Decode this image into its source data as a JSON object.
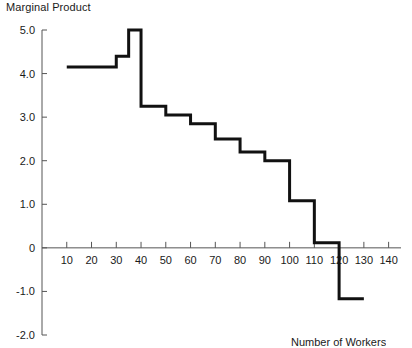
{
  "chart_data": {
    "type": "line",
    "style": "step-post",
    "title": "Marginal Product",
    "xlabel": "Number of Workers",
    "ylabel": "Marginal Product",
    "xlim": [
      0,
      145
    ],
    "ylim": [
      -2.0,
      5.0
    ],
    "grid": false,
    "legend": null,
    "xticks": [
      10,
      20,
      30,
      40,
      50,
      60,
      70,
      80,
      90,
      100,
      110,
      120,
      130,
      140
    ],
    "xticklabels": [
      "10",
      "20",
      "30",
      "40",
      "50",
      "60",
      "70",
      "80",
      "90",
      "100",
      "110",
      "120",
      "130",
      "140"
    ],
    "yticks": [
      5.0,
      4.0,
      3.0,
      2.0,
      1.0,
      0,
      -1.0,
      -2.0
    ],
    "yticklabels": [
      "5.0",
      "4.0",
      "3.0",
      "2.0",
      "1.0",
      "0",
      "-1.0",
      "-2.0"
    ],
    "steps": [
      {
        "x_start": 10,
        "x_end": 20,
        "value": 4.15
      },
      {
        "x_start": 20,
        "x_end": 30,
        "value": 4.15
      },
      {
        "x_start": 30,
        "x_end": 35,
        "value": 4.4
      },
      {
        "x_start": 35,
        "x_end": 40,
        "value": 5.0
      },
      {
        "x_start": 40,
        "x_end": 50,
        "value": 3.25
      },
      {
        "x_start": 50,
        "x_end": 60,
        "value": 3.05
      },
      {
        "x_start": 60,
        "x_end": 70,
        "value": 2.85
      },
      {
        "x_start": 70,
        "x_end": 80,
        "value": 2.5
      },
      {
        "x_start": 80,
        "x_end": 90,
        "value": 2.2
      },
      {
        "x_start": 90,
        "x_end": 100,
        "value": 2.0
      },
      {
        "x_start": 100,
        "x_end": 110,
        "value": 1.08
      },
      {
        "x_start": 110,
        "x_end": 120,
        "value": 0.12
      },
      {
        "x_start": 120,
        "x_end": 130,
        "value": -1.17
      }
    ],
    "x": [
      10,
      20,
      30,
      35,
      40,
      50,
      60,
      70,
      80,
      90,
      100,
      110,
      120,
      130
    ],
    "values": [
      4.15,
      4.15,
      4.4,
      5.0,
      3.25,
      3.05,
      2.85,
      2.5,
      2.2,
      2.0,
      1.08,
      0.12,
      -1.17,
      -1.17
    ],
    "line_color": "#111111",
    "axis_color": "#555555"
  }
}
